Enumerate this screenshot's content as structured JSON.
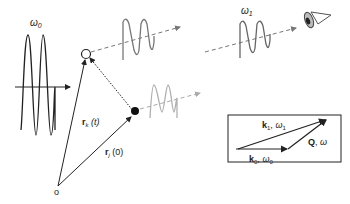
{
  "diagram": {
    "incident_wave": {
      "label": "ω0",
      "color": "#222222"
    },
    "origin": {
      "label": "o"
    },
    "vectors": {
      "rk": {
        "label_main": "r",
        "label_sub": "k",
        "label_arg": "(t)"
      },
      "rj": {
        "label_main": "r",
        "label_sub": "j",
        "label_arg": "(0)"
      }
    },
    "scattered_waves": [
      {
        "name": "from-particle-k",
        "color": "#777777"
      },
      {
        "name": "from-particle-j",
        "color": "#b0b0b0"
      }
    ],
    "detected_wave": {
      "label": "ω1",
      "color": "#666666"
    },
    "inset": {
      "k1_label": "k",
      "k1_sub": "1",
      "k1_freq": ", ω",
      "k1_freq_sub": "1",
      "q_label": "Q",
      "q_freq": ", ω",
      "k0_label": "k",
      "k0_sub": "0",
      "k0_freq": ", ω",
      "k0_freq_sub": "0"
    },
    "colors": {
      "line": "#222222",
      "dash": "#777777",
      "detector": "#555555"
    }
  }
}
